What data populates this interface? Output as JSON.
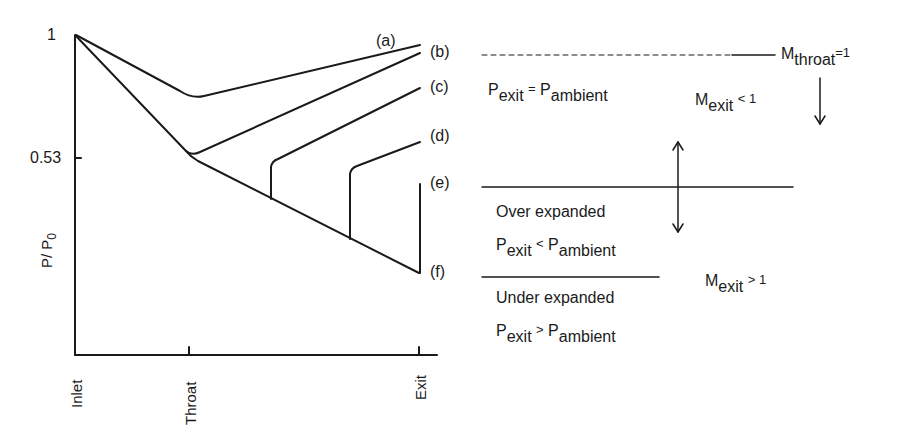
{
  "diagram": {
    "type": "nozzle_pressure_distribution",
    "y_axis": {
      "label_main": "P/ P",
      "label_sub": "0",
      "ticks": [
        {
          "label": "1",
          "value": 1.0
        },
        {
          "label": "0.53",
          "value": 0.53
        }
      ]
    },
    "x_axis": {
      "ticks": [
        {
          "label": "Inlet"
        },
        {
          "label": "Throat"
        },
        {
          "label": "Exit"
        }
      ]
    },
    "curves": [
      {
        "id": "a",
        "label": "(a)",
        "description": "subsonic throughout, minimum above 0.53 at throat"
      },
      {
        "id": "b",
        "label": "(b)",
        "description": "sonic at throat, subsonic diverging"
      },
      {
        "id": "c",
        "label": "(c)",
        "description": "normal shock in diverging section"
      },
      {
        "id": "d",
        "label": "(d)",
        "description": "normal shock further downstream"
      },
      {
        "id": "e",
        "label": "(e)",
        "description": "shock at exit"
      },
      {
        "id": "f",
        "label": "(f)",
        "description": "design condition, supersonic exit"
      }
    ],
    "annotations": {
      "mthroat": {
        "main": "M",
        "sub": "throat",
        "rest": "=1"
      },
      "pexit_eq": {
        "p1": "P",
        "s1": "exit",
        "op": "=",
        "p2": "P",
        "s2": "ambient"
      },
      "mexit_lt": {
        "main": "M",
        "sub": "exit",
        "rest": "< 1"
      },
      "over": {
        "title": "Over expanded",
        "p1": "P",
        "s1": "exit",
        "op": "<",
        "p2": "P",
        "s2": "ambient"
      },
      "under": {
        "title": "Under expanded",
        "p1": "P",
        "s1": "exit",
        "op": ">",
        "p2": "P",
        "s2": "ambient"
      },
      "mexit_gt": {
        "main": "M",
        "sub": "exit",
        "rest": "> 1"
      }
    },
    "colors": {
      "ink": "#1a1a1a",
      "background": "#ffffff"
    }
  }
}
